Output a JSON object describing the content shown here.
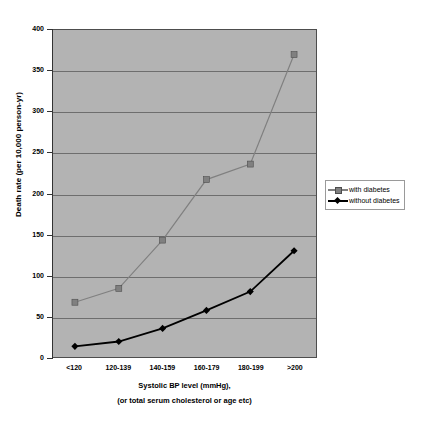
{
  "chart_data": {
    "type": "line",
    "title": "",
    "categories": [
      "<120",
      "120-139",
      "140-159",
      "160-179",
      "180-199",
      ">200"
    ],
    "series": [
      {
        "name": "with diabetes",
        "marker": "square",
        "color": "#808080",
        "values": [
          67,
          84,
          143,
          217,
          236,
          370
        ]
      },
      {
        "name": "without diabetes",
        "marker": "diamond",
        "color": "#000000",
        "values": [
          13,
          19,
          35,
          57,
          80,
          130
        ]
      }
    ],
    "xlabel": "Systolic BP level (mmHg),",
    "xlabel_line2": "(or total serum cholesterol or age etc)",
    "ylabel": "Death rate (per 10,000 person-yr)",
    "ylim": [
      0,
      400
    ],
    "yticks": [
      0,
      50,
      100,
      150,
      200,
      250,
      300,
      350,
      400
    ],
    "ytick_labels": [
      "0",
      "50",
      "100",
      "150",
      "200",
      "250",
      "300",
      "350",
      "400"
    ],
    "grid": true,
    "legend_position": "right",
    "plot_background": "#b3b3b3",
    "gridline_color": "#6e6e6e"
  },
  "legend": {
    "entries": [
      {
        "label": "with diabetes"
      },
      {
        "label": "without diabetes"
      }
    ]
  }
}
